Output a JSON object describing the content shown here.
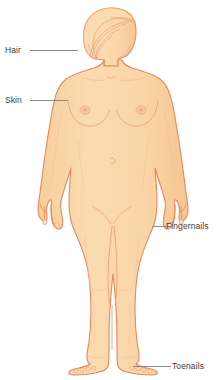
{
  "figure": {
    "background_color": "#ffffff"
  },
  "colors": {
    "skin_fill": "#fad7a8",
    "skin_fill_shadow": "#f6cb97",
    "outline": "#e8865c",
    "detail_line": "#e8a078",
    "leader_line": "#8b8b8b",
    "label_text": "#3b3b3b"
  },
  "labels": [
    {
      "id": "hair",
      "text": "Hair",
      "side": "left",
      "target": "scalp hair"
    },
    {
      "id": "skin",
      "text": "Skin",
      "side": "left",
      "target": "upper arm / shoulder skin"
    },
    {
      "id": "fingernails",
      "text": "Fingernails",
      "side": "right",
      "target": "right hand fingernails"
    },
    {
      "id": "toenails",
      "text": "Toenails",
      "side": "right",
      "target": "right foot toenails"
    }
  ]
}
